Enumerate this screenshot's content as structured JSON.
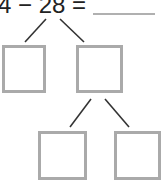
{
  "problem": {
    "equation_text": "4 − 28 =",
    "answer_value": ""
  },
  "number_bond": {
    "boxes": [
      {
        "id": "top-left",
        "value": ""
      },
      {
        "id": "top-right",
        "value": ""
      },
      {
        "id": "bottom-left",
        "value": ""
      },
      {
        "id": "bottom-right",
        "value": ""
      }
    ]
  },
  "colors": {
    "text": "#222222",
    "box_border": "#aaaaaa",
    "answer_line": "#b0b0b0",
    "branch_line": "#333333",
    "background": "#ffffff"
  }
}
